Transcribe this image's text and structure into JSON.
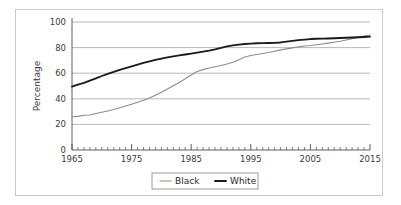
{
  "chart_data": {
    "type": "line",
    "title": "",
    "xlabel": "",
    "ylabel": "Percentage",
    "xlim": [
      1965,
      2015
    ],
    "ylim": [
      0,
      100
    ],
    "grid": true,
    "grid_axis": "y",
    "legend_position": "bottom-center",
    "x_ticks_major": [
      1965,
      1975,
      1985,
      1995,
      2005,
      2015
    ],
    "x_tick_labels": [
      "1965",
      "1975",
      "1985",
      "1995",
      "2005",
      "2015"
    ],
    "x_minor_tick_step": 1,
    "y_ticks": [
      0,
      20,
      40,
      60,
      80,
      100
    ],
    "y_tick_labels": [
      "0",
      "20",
      "40",
      "60",
      "80",
      "100"
    ],
    "x": [
      1965,
      1966,
      1967,
      1968,
      1969,
      1970,
      1971,
      1972,
      1973,
      1974,
      1975,
      1976,
      1977,
      1978,
      1979,
      1980,
      1981,
      1982,
      1983,
      1984,
      1985,
      1986,
      1987,
      1988,
      1989,
      1990,
      1991,
      1992,
      1993,
      1994,
      1995,
      1996,
      1997,
      1998,
      1999,
      2000,
      2001,
      2002,
      2003,
      2004,
      2005,
      2006,
      2007,
      2008,
      2009,
      2010,
      2011,
      2012,
      2013,
      2014,
      2015
    ],
    "series": [
      {
        "name": "Black",
        "color": "#8c8c8c",
        "line_width": 1.1,
        "values": [
          26.0,
          26.3,
          27.2,
          27.4,
          28.5,
          29.5,
          30.5,
          31.6,
          33.0,
          34.4,
          35.8,
          37.3,
          38.8,
          40.6,
          42.8,
          45.2,
          47.6,
          50.2,
          52.8,
          55.6,
          58.6,
          61.3,
          62.8,
          64.0,
          65.0,
          66.0,
          67.2,
          68.6,
          70.6,
          72.6,
          73.8,
          74.6,
          75.4,
          76.2,
          77.2,
          78.2,
          79.0,
          79.8,
          80.6,
          81.2,
          81.6,
          82.2,
          82.8,
          83.5,
          84.2,
          85.0,
          86.0,
          87.0,
          88.0,
          89.0,
          89.8
        ]
      },
      {
        "name": "White",
        "color": "#1a1a1a",
        "line_width": 1.8,
        "values": [
          49.5,
          51.0,
          52.5,
          54.2,
          56.0,
          57.8,
          59.4,
          61.0,
          62.6,
          64.0,
          65.4,
          66.7,
          68.0,
          69.2,
          70.4,
          71.4,
          72.3,
          73.2,
          73.9,
          74.6,
          75.3,
          76.0,
          76.8,
          77.6,
          78.6,
          79.8,
          81.0,
          81.8,
          82.4,
          82.8,
          83.1,
          83.4,
          83.5,
          83.6,
          83.7,
          84.0,
          84.6,
          85.2,
          85.8,
          86.3,
          86.7,
          86.9,
          87.0,
          87.1,
          87.3,
          87.5,
          87.7,
          87.9,
          88.1,
          88.3,
          88.5
        ]
      }
    ],
    "legend": [
      {
        "label": "Black",
        "color": "#8c8c8c",
        "swatch": "line-swatch-thin"
      },
      {
        "label": "White",
        "color": "#1a1a1a",
        "swatch": "line-swatch-thick"
      }
    ],
    "colors": {
      "frame": "#c9c9c9",
      "grid": "#a6a6a6",
      "axis": "#4d4d4d",
      "text": "#3a3a3a",
      "background": "#ffffff"
    }
  }
}
